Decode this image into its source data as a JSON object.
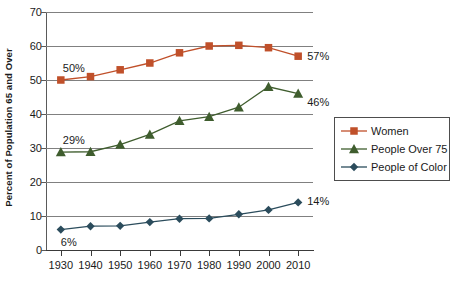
{
  "chart_data": {
    "type": "line",
    "title": "",
    "xlabel": "",
    "ylabel": "Percent of Population 65 and Over",
    "x": [
      1930,
      1940,
      1950,
      1960,
      1970,
      1980,
      1990,
      2000,
      2010
    ],
    "categories": [
      "1930",
      "1940",
      "1950",
      "1960",
      "1970",
      "1980",
      "1990",
      "2000",
      "2010"
    ],
    "xlim": [
      1925,
      2015
    ],
    "ylim": [
      0,
      70
    ],
    "yticks": [
      0,
      10,
      20,
      30,
      40,
      50,
      60,
      70
    ],
    "ytick_labels": [
      "0",
      "10",
      "20",
      "30",
      "40",
      "50",
      "60",
      "70"
    ],
    "grid": true,
    "legend_position": "right",
    "series": [
      {
        "name": "Women",
        "color": "#C0502A",
        "marker": "square",
        "values": [
          50,
          51,
          53,
          55,
          58,
          60,
          60.2,
          59.5,
          57
        ]
      },
      {
        "name": "People Over 75",
        "color": "#3F5D2E",
        "marker": "triangle",
        "values": [
          28.8,
          28.9,
          31,
          34,
          38,
          39.2,
          42,
          48,
          46
        ]
      },
      {
        "name": "People of Color",
        "color": "#2B4C5C",
        "marker": "diamond",
        "values": [
          6,
          7,
          7.1,
          8.2,
          9.2,
          9.3,
          10.5,
          11.8,
          14
        ]
      }
    ],
    "annotations": [
      {
        "text": "50%",
        "series": "Women",
        "x": 1930,
        "value": 50
      },
      {
        "text": "57%",
        "series": "Women",
        "x": 2010,
        "value": 57
      },
      {
        "text": "29%",
        "series": "People Over 75",
        "x": 1930,
        "value": 28.8
      },
      {
        "text": "46%",
        "series": "People Over 75",
        "x": 2010,
        "value": 46
      },
      {
        "text": "6%",
        "series": "People of Color",
        "x": 1930,
        "value": 6
      },
      {
        "text": "14%",
        "series": "People of Color",
        "x": 2010,
        "value": 14
      }
    ]
  },
  "legend": {
    "items": [
      {
        "label": "Women",
        "color": "#C0502A",
        "marker": "square"
      },
      {
        "label": "People Over 75",
        "color": "#3F5D2E",
        "marker": "triangle"
      },
      {
        "label": "People of Color",
        "color": "#2B4C5C",
        "marker": "diamond"
      }
    ]
  },
  "axes": {
    "y_title": "Percent of Population 65 and Over"
  },
  "colors": {
    "gridline": "#808080",
    "axis": "#3a3a3a",
    "text": "#1a1a1a"
  }
}
